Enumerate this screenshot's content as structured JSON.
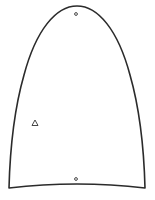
{
  "figure": {
    "shape": "dome-outline",
    "stroke_color": "#2b2b2b",
    "background": "#ffffff",
    "markers": [
      {
        "type": "circle",
        "label": "top-marker",
        "x": 76,
        "y": 14
      },
      {
        "type": "triangle",
        "label": "left-marker",
        "x": 35,
        "y": 123
      },
      {
        "type": "circle",
        "label": "bottom-marker",
        "x": 76,
        "y": 179
      }
    ]
  }
}
